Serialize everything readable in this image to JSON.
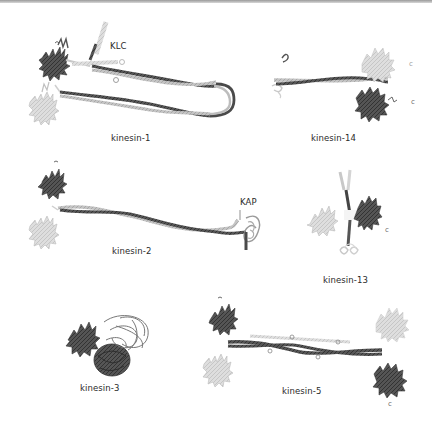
{
  "figure": {
    "type": "kinesin-superfamily-structures",
    "colors": {
      "dark_chain": "#4a4a4a",
      "light_chain": "#b8b8b8",
      "very_light_chain": "#d2d2d2",
      "background": "#ffffff"
    }
  },
  "panels": [
    {
      "id": "kinesin-1",
      "label": "kinesin-1",
      "annotation": "KLC"
    },
    {
      "id": "kinesin-14",
      "label": "kinesin-14",
      "annotation": ""
    },
    {
      "id": "kinesin-2",
      "label": "kinesin-2",
      "annotation": "KAP"
    },
    {
      "id": "kinesin-13",
      "label": "kinesin-13",
      "annotation": ""
    },
    {
      "id": "kinesin-3",
      "label": "kinesin-3",
      "annotation": ""
    },
    {
      "id": "kinesin-5",
      "label": "kinesin-5",
      "annotation": ""
    }
  ],
  "terminal_marks": {
    "c_terminus": "c"
  }
}
